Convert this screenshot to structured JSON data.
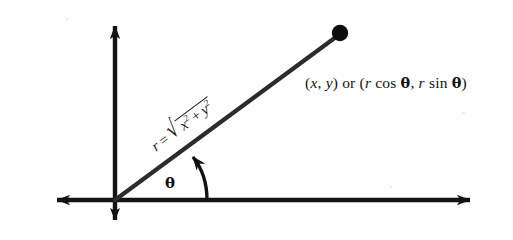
{
  "figure": {
    "background_color": "#fefefe",
    "ink_color": "#1a1a1a"
  },
  "axes": {
    "x_axis_name": "horizontal axis",
    "y_axis_name": "vertical axis",
    "origin": {
      "x": 115,
      "y": 200
    },
    "x_axis_left_tip": {
      "x": 42,
      "y": 200
    },
    "x_axis_right_tip": {
      "x": 485,
      "y": 200
    },
    "y_axis_top_tip": {
      "x": 115,
      "y": 12
    },
    "y_axis_bottom_tip": {
      "x": 115,
      "y": 232
    }
  },
  "ray": {
    "from": {
      "x": 115,
      "y": 200
    },
    "to": {
      "x": 336,
      "y": 37
    },
    "angle_degrees": 36.6,
    "stroke_width": 4.2
  },
  "point": {
    "name": "terminal point",
    "center": {
      "x": 340,
      "y": 33
    },
    "radius": 8
  },
  "angle_arc": {
    "start": {
      "x": 207,
      "y": 200
    },
    "end": {
      "x": 190,
      "y": 152
    },
    "arrow_direction": "counterclockwise"
  },
  "labels": {
    "point_label": {
      "coord_x": "x",
      "coord_y": "y",
      "conjunction": "or",
      "polar_x": "cos",
      "polar_y": "sin",
      "radius_symbol": "r",
      "theta_symbol": "θ",
      "full_text": "(x, y) or (r cos θ, r sin θ)"
    },
    "theta_label": {
      "text": "θ"
    },
    "radius_formula": {
      "radius_symbol": "r",
      "equals": "=",
      "radical_symbol": "√",
      "term_x": "x",
      "exponent_x": "2",
      "plus": "+",
      "term_y": "y",
      "exponent_y": "2",
      "full_text": "r = √(x² + y²)"
    }
  }
}
